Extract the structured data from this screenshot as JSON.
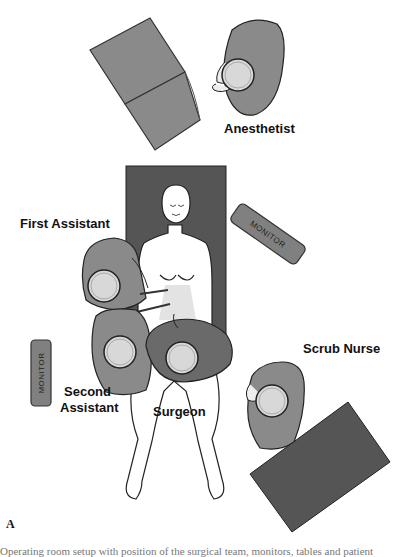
{
  "figure": {
    "panel_label": "A",
    "caption_partial": "Operating room setup with position of the surgical team, monitors, tables and patient"
  },
  "roles": {
    "anesthetist": "Anesthetist",
    "first_assistant": "First Assistant",
    "second_assistant_line1": "Second",
    "second_assistant_line2": "Assistant",
    "surgeon": "Surgeon",
    "scrub_nurse": "Scrub Nurse"
  },
  "equipment": {
    "monitor_right": "MONITOR",
    "monitor_left": "MONITOR"
  },
  "colors": {
    "table_dark": "#555555",
    "gown_light": "#8a8a8a",
    "gown_dark": "#6a6a6a",
    "cap": "#d8d8d8",
    "monitor": "#808080"
  }
}
